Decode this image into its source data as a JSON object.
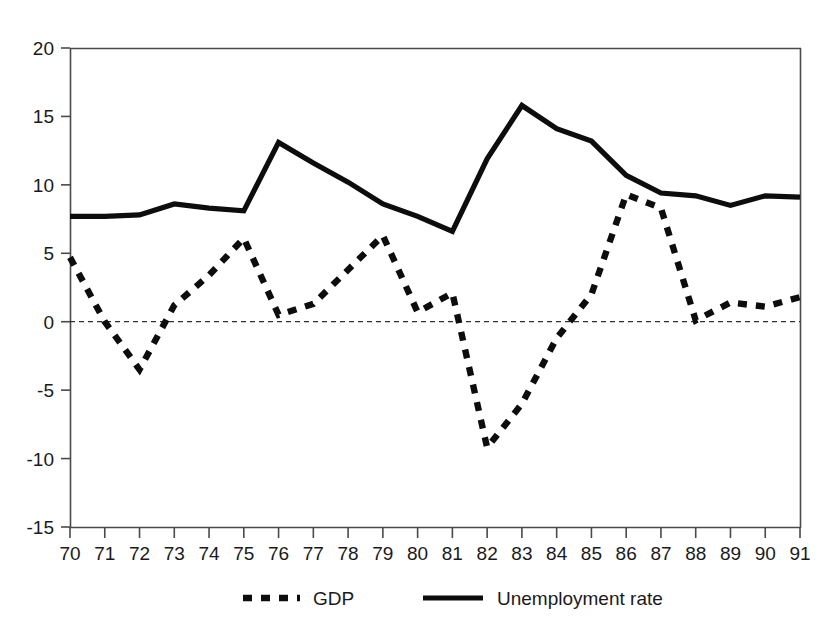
{
  "chart_data": {
    "type": "line",
    "title": "",
    "subtitle": "",
    "xlabel": "",
    "ylabel": "",
    "x": [
      "70",
      "71",
      "72",
      "73",
      "74",
      "75",
      "76",
      "77",
      "78",
      "79",
      "80",
      "81",
      "82",
      "83",
      "84",
      "85",
      "86",
      "87",
      "88",
      "89",
      "90",
      "91"
    ],
    "xlim": [
      0,
      21
    ],
    "ylim": [
      -15,
      20
    ],
    "yticks": [
      "20",
      "15",
      "10",
      "5",
      "0",
      "-5",
      "-10",
      "-15"
    ],
    "ytick_values": [
      20,
      15,
      10,
      5,
      0,
      -5,
      -10,
      -15
    ],
    "grid": false,
    "zero_line": true,
    "legend_position": "bottom",
    "series": [
      {
        "name": "GDP",
        "style": "dashed",
        "values": [
          4.7,
          0.0,
          -3.5,
          1.2,
          3.4,
          6.1,
          0.5,
          1.3,
          3.8,
          6.3,
          0.7,
          2.1,
          -9.2,
          -6.0,
          -1.2,
          2.0,
          9.3,
          8.3,
          0.1,
          1.4,
          1.1,
          1.8
        ]
      },
      {
        "name": "Unemployment rate",
        "style": "solid",
        "values": [
          7.7,
          7.7,
          7.8,
          8.6,
          8.3,
          8.1,
          13.1,
          11.6,
          10.2,
          8.6,
          7.7,
          6.6,
          11.9,
          15.8,
          14.1,
          13.2,
          10.7,
          9.4,
          9.2,
          8.5,
          9.2,
          9.1
        ]
      }
    ],
    "legend": [
      {
        "label": "GDP",
        "style": "dashed"
      },
      {
        "label": "Unemployment rate",
        "style": "solid"
      }
    ]
  }
}
